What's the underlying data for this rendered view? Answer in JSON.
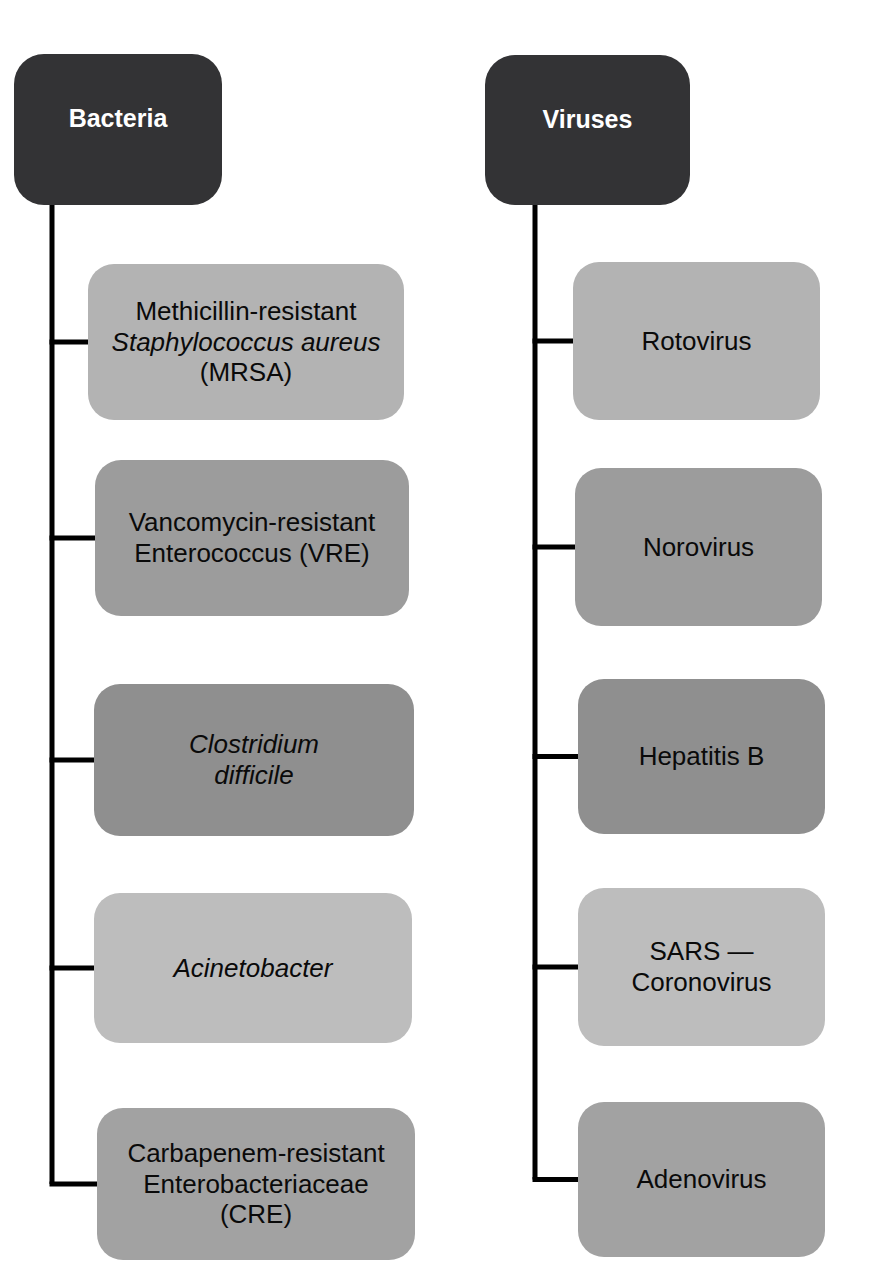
{
  "diagram": {
    "type": "tree",
    "orientation": "two-column-vertical",
    "background": "#ffffff",
    "root_color": "#333335",
    "line_color": "#000000",
    "columns": [
      {
        "id": "bacteria-column",
        "root": {
          "label": "Bacteria",
          "color": "#333335",
          "text_color": "#ffffff",
          "x": 14,
          "y": 54,
          "w": 208,
          "h": 151
        },
        "trunk_x": 52,
        "children": [
          {
            "id": "mrsa",
            "color": "#b3b3b3",
            "x": 88,
            "y": 264,
            "w": 316,
            "h": 156,
            "lines": [
              {
                "text": "Methicillin-resistant",
                "italic": false
              },
              {
                "text": "Staphylococcus aureus",
                "italic": true
              },
              {
                "text": "(MRSA)",
                "italic": false
              }
            ]
          },
          {
            "id": "vre",
            "color": "#9c9c9c",
            "x": 95,
            "y": 460,
            "w": 314,
            "h": 156,
            "lines": [
              {
                "text": "Vancomycin-resistant",
                "italic": false
              },
              {
                "text": "Enterococcus (VRE)",
                "italic": false
              }
            ]
          },
          {
            "id": "cdiff",
            "color": "#8f8f8f",
            "x": 94,
            "y": 684,
            "w": 320,
            "h": 152,
            "lines": [
              {
                "text": "Clostridium",
                "italic": true
              },
              {
                "text": "difficile",
                "italic": true
              }
            ]
          },
          {
            "id": "acinetobacter",
            "color": "#bdbdbd",
            "x": 94,
            "y": 893,
            "w": 318,
            "h": 150,
            "lines": [
              {
                "text": "Acinetobacter",
                "italic": true
              }
            ]
          },
          {
            "id": "cre",
            "color": "#a2a2a2",
            "x": 97,
            "y": 1108,
            "w": 318,
            "h": 152,
            "lines": [
              {
                "text": "Carbapenem-resistant",
                "italic": false
              },
              {
                "text": "Enterobacteriaceae",
                "italic": false
              },
              {
                "text": "(CRE)",
                "italic": false
              }
            ]
          }
        ]
      },
      {
        "id": "viruses-column",
        "root": {
          "label": "Viruses",
          "color": "#333335",
          "text_color": "#ffffff",
          "x": 485,
          "y": 55,
          "w": 205,
          "h": 150
        },
        "trunk_x": 535,
        "children": [
          {
            "id": "rotovirus",
            "color": "#b3b3b3",
            "x": 573,
            "y": 262,
            "w": 247,
            "h": 158,
            "lines": [
              {
                "text": "Rotovirus",
                "italic": false
              }
            ]
          },
          {
            "id": "norovirus",
            "color": "#9c9c9c",
            "x": 575,
            "y": 468,
            "w": 247,
            "h": 158,
            "lines": [
              {
                "text": "Norovirus",
                "italic": false
              }
            ]
          },
          {
            "id": "hepatitis-b",
            "color": "#8f8f8f",
            "x": 578,
            "y": 679,
            "w": 247,
            "h": 155,
            "lines": [
              {
                "text": "Hepatitis B",
                "italic": false
              }
            ]
          },
          {
            "id": "sars-coronovirus",
            "color": "#bdbdbd",
            "x": 578,
            "y": 888,
            "w": 247,
            "h": 158,
            "lines": [
              {
                "text": "SARS —",
                "italic": false
              },
              {
                "text": "Coronovirus",
                "italic": false
              }
            ]
          },
          {
            "id": "adenovirus",
            "color": "#a2a2a2",
            "x": 578,
            "y": 1102,
            "w": 247,
            "h": 155,
            "lines": [
              {
                "text": "Adenovirus",
                "italic": false
              }
            ]
          }
        ]
      }
    ]
  }
}
